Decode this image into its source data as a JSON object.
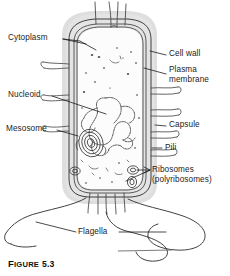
{
  "figure": {
    "caption_prefix": "F",
    "caption_word": "IGURE",
    "caption_number": "5.3",
    "caption_full": "FIGURE 5.3"
  },
  "diagram": {
    "background_color": "#ffffff",
    "ink_color": "#1c1c1c",
    "capsule_halo_color": "#d9d9d9",
    "cytoplasm_color": "#fdfdfd"
  },
  "labels": {
    "cytoplasm": "Cytoplasm",
    "nucleoid": "Nucleoid",
    "mesosome": "Mesosome",
    "cell_wall": "Cell wall",
    "plasma_membrane_line1": "Plasma",
    "plasma_membrane_line2": "membrane",
    "capsule": "Capsule",
    "pili": "Pili",
    "ribosomes_line1": "Ribosomes",
    "ribosomes_line2": "(polyribosomes)",
    "flagella": "Flagella"
  }
}
